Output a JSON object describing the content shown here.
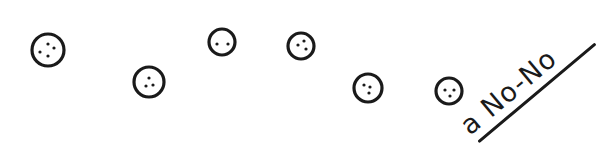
{
  "drawing": {
    "stroke_color": "#1a1a1a",
    "background_color": "#ffffff",
    "circles": [
      {
        "cx": 48,
        "cy": 50,
        "r": 16,
        "dots": [
          [
            0,
            -6
          ],
          [
            6,
            -2
          ],
          [
            -8,
            2
          ],
          [
            0,
            6
          ]
        ]
      },
      {
        "cx": 149,
        "cy": 82,
        "r": 15,
        "dots": [
          [
            0,
            -4
          ],
          [
            -3,
            4
          ],
          [
            4,
            3
          ]
        ]
      },
      {
        "cx": 222,
        "cy": 42,
        "r": 13,
        "dots": [
          [
            -5,
            2
          ],
          [
            6,
            2
          ]
        ]
      },
      {
        "cx": 301,
        "cy": 46,
        "r": 13,
        "dots": [
          [
            3,
            -5
          ],
          [
            -3,
            -1
          ],
          [
            5,
            3
          ]
        ]
      },
      {
        "cx": 368,
        "cy": 88,
        "r": 14,
        "dots": [
          [
            -4,
            -3
          ],
          [
            2,
            -1
          ],
          [
            1,
            5
          ]
        ]
      },
      {
        "cx": 449,
        "cy": 91,
        "r": 13,
        "dots": [
          [
            -4,
            -1
          ],
          [
            5,
            -1
          ],
          [
            1,
            5
          ]
        ]
      }
    ]
  },
  "caption": {
    "text": "a No-No",
    "rotation_deg": -40
  }
}
